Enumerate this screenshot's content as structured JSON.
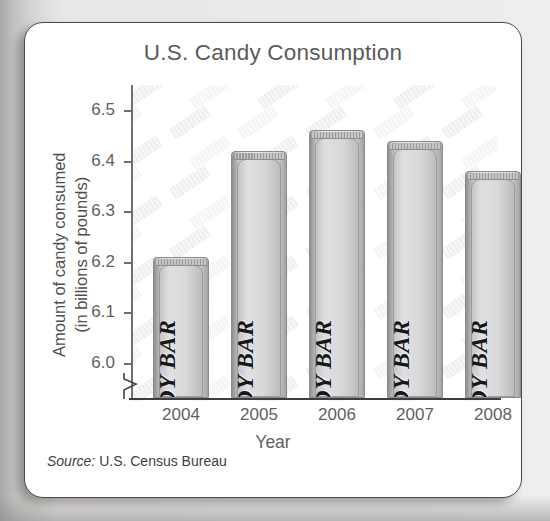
{
  "card": {
    "source_lead": "Source:",
    "source_text": " U.S. Census Bureau"
  },
  "chart_data": {
    "type": "bar",
    "title": "U.S. Candy Consumption",
    "xlabel": "Year",
    "ylabel": "Amount of candy consumed\n(in billions of pounds)",
    "ylabel_line1": "Amount of candy consumed",
    "ylabel_line2": "(in billions of pounds)",
    "categories": [
      "2004",
      "2005",
      "2006",
      "2007",
      "2008"
    ],
    "values": [
      6.21,
      6.42,
      6.46,
      6.44,
      6.38
    ],
    "ylim": [
      5.93,
      6.55
    ],
    "yticks": [
      "6.0",
      "6.1",
      "6.2",
      "6.3",
      "6.4",
      "6.5"
    ],
    "ytick_values": [
      6.0,
      6.1,
      6.2,
      6.3,
      6.4,
      6.5
    ],
    "grid": false,
    "legend": null,
    "axis_break": true,
    "bar_glyph_label": "CANDY BAR",
    "series_name": "Amount of candy consumed",
    "colors": {
      "bar_fill": "#dcdcde",
      "bar_edge": "#8b8b8d",
      "axis": "#3d3d3f",
      "text": "#5f5f61",
      "title": "#5b5b5d",
      "card_bg": "#ffffff",
      "page_bg": "#d8d6d4"
    }
  }
}
